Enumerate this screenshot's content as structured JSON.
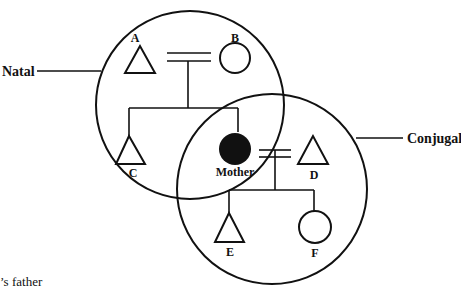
{
  "diagram": {
    "type": "kinship-venn",
    "groups": [
      {
        "id": "natal",
        "label": "Natal"
      },
      {
        "id": "conjugal",
        "label": "Conjugal"
      }
    ],
    "nodes": [
      {
        "id": "A",
        "label": "A",
        "shape": "triangle",
        "sex": "male",
        "group": "natal"
      },
      {
        "id": "B",
        "label": "B",
        "shape": "circle",
        "sex": "female",
        "group": "natal"
      },
      {
        "id": "C",
        "label": "C",
        "shape": "triangle",
        "sex": "male",
        "group": "natal"
      },
      {
        "id": "Mother",
        "label": "Mother",
        "shape": "circle",
        "sex": "female",
        "filled": true,
        "group": "both"
      },
      {
        "id": "D",
        "label": "D",
        "shape": "triangle",
        "sex": "male",
        "group": "conjugal"
      },
      {
        "id": "E",
        "label": "E",
        "shape": "triangle",
        "sex": "male",
        "group": "conjugal"
      },
      {
        "id": "F",
        "label": "F",
        "shape": "circle",
        "sex": "female",
        "group": "conjugal"
      }
    ],
    "marriages": [
      {
        "spouses": [
          "A",
          "B"
        ],
        "children": [
          "C",
          "Mother"
        ]
      },
      {
        "spouses": [
          "Mother",
          "D"
        ],
        "children": [
          "E",
          "F"
        ]
      }
    ],
    "caption_fragment": "’s father"
  }
}
